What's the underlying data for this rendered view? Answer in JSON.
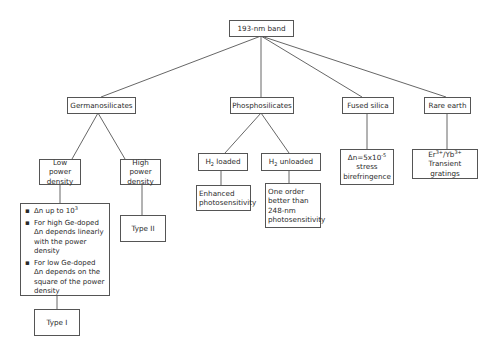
{
  "diagram": {
    "root": {
      "label": "193-nm band"
    },
    "categories": [
      {
        "id": "germano",
        "label": "Germanosilicates"
      },
      {
        "id": "phospho",
        "label": "Phosphosilicates"
      },
      {
        "id": "fused",
        "label": "Fused silica"
      },
      {
        "id": "rare",
        "label": "Rare earth"
      }
    ],
    "germanosilicates": {
      "low_power": {
        "label": "Low power density"
      },
      "high_power": {
        "label": "High power density"
      },
      "low_power_details": {
        "bullets": [
          {
            "prefix": "Δn up to 10",
            "sup": "3"
          },
          {
            "text": "For high Ge-doped Δn depends linearly with the power density"
          },
          {
            "text": "For low Ge-doped Δn depends on the square of the power density"
          }
        ]
      },
      "type_i": {
        "label": "Type I"
      },
      "type_ii": {
        "label": "Type II"
      }
    },
    "phosphosilicates": {
      "h2_loaded": {
        "h": "H",
        "sub": "2",
        "rest": " loaded"
      },
      "h2_unloaded": {
        "h": "H",
        "sub": "2",
        "rest": " unloaded"
      },
      "enhanced": {
        "label": "Enhanced photosensitivity"
      },
      "one_order": {
        "label": "One order better than 248-nm photosensitivity"
      }
    },
    "fused_silica": {
      "detail": {
        "prefix": "Δn=5x10",
        "sup": "-5",
        "line2": "stress",
        "line3": "birefringence"
      }
    },
    "rare_earth": {
      "detail": {
        "er": "Er",
        "er_sup": "3+",
        "slash": "/Yb",
        "yb_sup": "3+",
        "line2": "Transient gratings"
      }
    }
  },
  "colors": {
    "line": "#555555",
    "text": "#2a2a2a",
    "background": "#ffffff"
  }
}
